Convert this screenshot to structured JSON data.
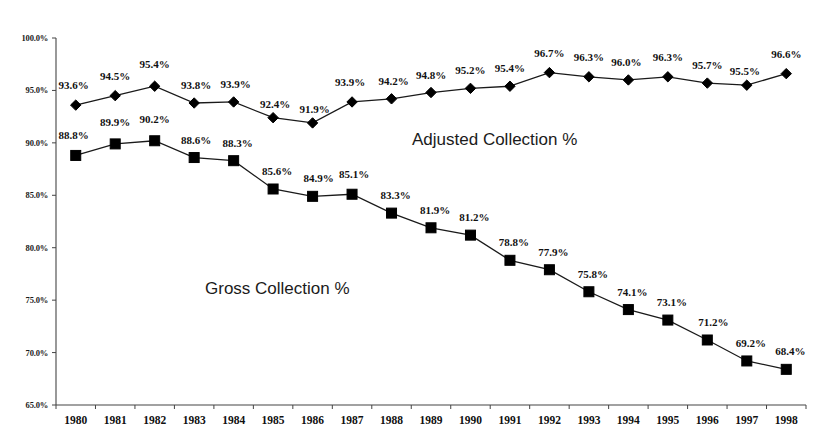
{
  "chart_data": {
    "type": "line",
    "title": "",
    "subtitle": "",
    "xlabel": "",
    "ylabel": "",
    "ylim": [
      65,
      100
    ],
    "yticks": [
      "65.0%",
      "70.0%",
      "75.0%",
      "80.0%",
      "85.0%",
      "90.0%",
      "95.0%",
      "100.0%"
    ],
    "ytick_values": [
      65,
      70,
      75,
      80,
      85,
      90,
      95,
      100
    ],
    "grid": false,
    "legend_position": "inline-annotation",
    "categories": [
      "1980",
      "1981",
      "1982",
      "1983",
      "1984",
      "1985",
      "1986",
      "1987",
      "1988",
      "1989",
      "1990",
      "1991",
      "1992",
      "1993",
      "1994",
      "1995",
      "1996",
      "1997",
      "1998"
    ],
    "series": [
      {
        "name": "Adjusted Collection %",
        "marker": "diamond",
        "values": [
          93.6,
          94.5,
          95.4,
          93.8,
          93.9,
          92.4,
          91.9,
          93.9,
          94.2,
          94.8,
          95.2,
          95.4,
          96.7,
          96.3,
          96.0,
          96.3,
          95.7,
          95.5,
          96.6
        ],
        "labels": [
          "93.6%",
          "94.5%",
          "95.4%",
          "93.8%",
          "93.9%",
          "92.4%",
          "91.9%",
          "93.9%",
          "94.2%",
          "94.8%",
          "95.2%",
          "95.4%",
          "96.7%",
          "96.3%",
          "96.0%",
          "96.3%",
          "95.7%",
          "95.5%",
          "96.6%"
        ]
      },
      {
        "name": "Gross Collection %",
        "marker": "square",
        "values": [
          88.8,
          89.9,
          90.2,
          88.6,
          88.3,
          85.6,
          84.9,
          85.1,
          83.3,
          81.9,
          81.2,
          78.8,
          77.9,
          75.8,
          74.1,
          73.1,
          71.2,
          69.2,
          68.4
        ],
        "labels": [
          "88.8%",
          "89.9%",
          "90.2%",
          "88.6%",
          "88.3%",
          "85.6%",
          "84.9%",
          "85.1%",
          "83.3%",
          "81.9%",
          "81.2%",
          "78.8%",
          "77.9%",
          "75.8%",
          "74.1%",
          "73.1%",
          "71.2%",
          "69.2%",
          "68.4%"
        ]
      }
    ],
    "annotations": [
      {
        "text": "Adjusted Collection %",
        "series": "Adjusted Collection %"
      },
      {
        "text": "Gross Collection %",
        "series": "Gross Collection %"
      }
    ],
    "colors": {
      "line": "#1a1a1a",
      "marker": "#000000",
      "axis": "#444444",
      "text": "#111111",
      "background": "#ffffff"
    }
  }
}
